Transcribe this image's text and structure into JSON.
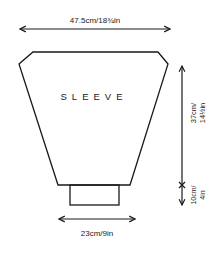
{
  "diagram": {
    "title": "SLEEVE",
    "stroke_color": "#1a1a1a",
    "background": "#ffffff",
    "measurements": {
      "top_width": "47.5cm/18¾in",
      "cuff_width": "23cm/9in",
      "sleeve_length_line1": "37cm/",
      "sleeve_length_line2": "14½in",
      "cuff_length_line1": "10cm/",
      "cuff_length_line2": "4in"
    }
  }
}
